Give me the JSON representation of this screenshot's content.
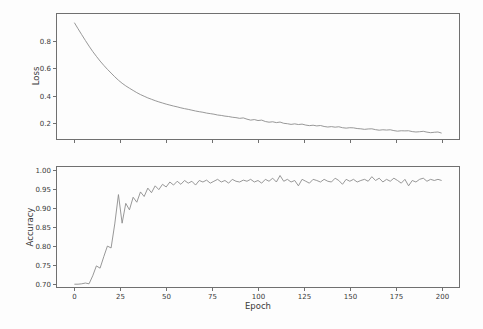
{
  "figure": {
    "background_color": "#fdfdfd",
    "spine_color": "#707070",
    "tick_label_color": "#3a3a3a"
  },
  "labels": {
    "loss_ylabel": "Loss",
    "accuracy_ylabel": "Accuracy",
    "xlabel": "Epoch"
  },
  "chart_data": [
    {
      "id": "loss",
      "type": "line",
      "title": "",
      "xlabel": "",
      "ylabel": "Loss",
      "legend": "none",
      "grid": false,
      "line_color": "#8c8c8c",
      "xlim": [
        -10,
        210
      ],
      "ylim": [
        0.08,
        1.0
      ],
      "xticks": [
        0,
        25,
        50,
        75,
        100,
        125,
        150,
        175,
        200
      ],
      "xtick_labels": [
        "0",
        "25",
        "50",
        "75",
        "100",
        "125",
        "150",
        "175",
        "200"
      ],
      "xtick_labels_visible": false,
      "yticks": [
        0.2,
        0.4,
        0.6,
        0.8
      ],
      "ytick_labels": [
        "0.2",
        "0.4",
        "0.6",
        "0.8"
      ],
      "x": [
        0,
        2,
        4,
        6,
        8,
        10,
        12,
        14,
        16,
        18,
        20,
        22,
        24,
        26,
        28,
        30,
        32,
        34,
        36,
        38,
        40,
        42,
        44,
        46,
        48,
        50,
        52,
        54,
        56,
        58,
        60,
        62,
        64,
        66,
        68,
        70,
        72,
        74,
        76,
        78,
        80,
        82,
        84,
        86,
        88,
        90,
        92,
        94,
        96,
        98,
        100,
        102,
        104,
        106,
        108,
        110,
        112,
        114,
        116,
        118,
        120,
        122,
        124,
        126,
        128,
        130,
        132,
        134,
        136,
        138,
        140,
        142,
        144,
        146,
        148,
        150,
        152,
        154,
        156,
        158,
        160,
        162,
        164,
        166,
        168,
        170,
        172,
        174,
        176,
        178,
        180,
        182,
        184,
        186,
        188,
        190,
        192,
        194,
        196,
        198,
        200
      ],
      "y": [
        0.93,
        0.886,
        0.843,
        0.801,
        0.76,
        0.721,
        0.686,
        0.652,
        0.621,
        0.592,
        0.565,
        0.538,
        0.513,
        0.491,
        0.472,
        0.455,
        0.439,
        0.423,
        0.409,
        0.397,
        0.385,
        0.375,
        0.365,
        0.356,
        0.348,
        0.34,
        0.333,
        0.326,
        0.32,
        0.313,
        0.307,
        0.302,
        0.296,
        0.29,
        0.285,
        0.281,
        0.275,
        0.271,
        0.267,
        0.261,
        0.258,
        0.253,
        0.25,
        0.245,
        0.242,
        0.237,
        0.24,
        0.231,
        0.224,
        0.228,
        0.221,
        0.224,
        0.214,
        0.209,
        0.212,
        0.206,
        0.21,
        0.201,
        0.198,
        0.193,
        0.197,
        0.192,
        0.195,
        0.188,
        0.184,
        0.187,
        0.182,
        0.185,
        0.178,
        0.174,
        0.177,
        0.173,
        0.176,
        0.169,
        0.166,
        0.169,
        0.168,
        0.163,
        0.161,
        0.157,
        0.16,
        0.161,
        0.155,
        0.151,
        0.154,
        0.152,
        0.154,
        0.148,
        0.144,
        0.147,
        0.146,
        0.147,
        0.141,
        0.138,
        0.14,
        0.143,
        0.137,
        0.133,
        0.136,
        0.138,
        0.13
      ]
    },
    {
      "id": "accuracy",
      "type": "line",
      "title": "",
      "xlabel": "Epoch",
      "ylabel": "Accuracy",
      "legend": "none",
      "grid": false,
      "line_color": "#8c8c8c",
      "xlim": [
        -10,
        210
      ],
      "ylim": [
        0.69,
        1.01
      ],
      "xticks": [
        0,
        25,
        50,
        75,
        100,
        125,
        150,
        175,
        200
      ],
      "xtick_labels": [
        "0",
        "25",
        "50",
        "75",
        "100",
        "125",
        "150",
        "175",
        "200"
      ],
      "xtick_labels_visible": true,
      "yticks": [
        0.7,
        0.75,
        0.8,
        0.85,
        0.9,
        0.95,
        1.0
      ],
      "ytick_labels": [
        "0.70",
        "0.75",
        "0.80",
        "0.85",
        "0.90",
        "0.95",
        "1.00"
      ],
      "x": [
        0,
        2,
        4,
        6,
        8,
        10,
        12,
        14,
        16,
        18,
        20,
        22,
        24,
        26,
        28,
        30,
        32,
        34,
        36,
        38,
        40,
        42,
        44,
        46,
        48,
        50,
        52,
        54,
        56,
        58,
        60,
        62,
        64,
        66,
        68,
        70,
        72,
        74,
        76,
        78,
        80,
        82,
        84,
        86,
        88,
        90,
        92,
        94,
        96,
        98,
        100,
        102,
        104,
        106,
        108,
        110,
        112,
        114,
        116,
        118,
        120,
        122,
        124,
        126,
        128,
        130,
        132,
        134,
        136,
        138,
        140,
        142,
        144,
        146,
        148,
        150,
        152,
        154,
        156,
        158,
        160,
        162,
        164,
        166,
        168,
        170,
        172,
        174,
        176,
        178,
        180,
        182,
        184,
        186,
        188,
        190,
        192,
        194,
        196,
        198,
        200
      ],
      "y": [
        0.7,
        0.7,
        0.701,
        0.703,
        0.701,
        0.722,
        0.748,
        0.742,
        0.772,
        0.8,
        0.795,
        0.858,
        0.935,
        0.86,
        0.912,
        0.895,
        0.928,
        0.915,
        0.942,
        0.93,
        0.952,
        0.94,
        0.958,
        0.948,
        0.962,
        0.955,
        0.968,
        0.96,
        0.97,
        0.962,
        0.972,
        0.965,
        0.97,
        0.96,
        0.972,
        0.968,
        0.973,
        0.965,
        0.97,
        0.975,
        0.968,
        0.972,
        0.965,
        0.975,
        0.97,
        0.968,
        0.973,
        0.97,
        0.975,
        0.968,
        0.972,
        0.965,
        0.975,
        0.97,
        0.978,
        0.968,
        0.985,
        0.97,
        0.975,
        0.968,
        0.972,
        0.958,
        0.975,
        0.97,
        0.965,
        0.975,
        0.972,
        0.968,
        0.975,
        0.97,
        0.968,
        0.978,
        0.972,
        0.962,
        0.975,
        0.97,
        0.975,
        0.968,
        0.972,
        0.975,
        0.97,
        0.982,
        0.972,
        0.978,
        0.968,
        0.975,
        0.97,
        0.978,
        0.972,
        0.965,
        0.975,
        0.958,
        0.972,
        0.968,
        0.975,
        0.978,
        0.97,
        0.975,
        0.972,
        0.975,
        0.972
      ]
    }
  ]
}
